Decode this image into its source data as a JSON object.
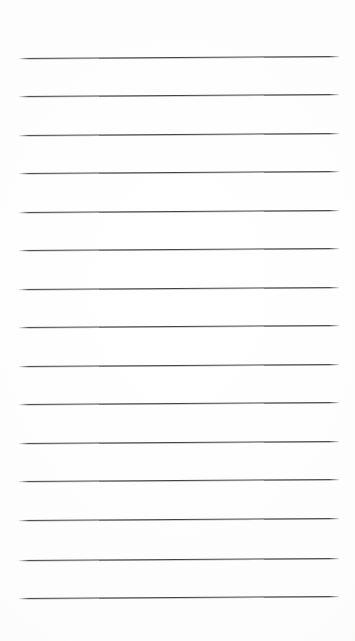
{
  "page": {
    "width": 355,
    "height": 641,
    "background_color": "#fefefe",
    "content_text": ""
  },
  "rules": {
    "name": "horizontal-rule-lines",
    "count": 15,
    "color": "#3b3b3b",
    "thickness_px": 1,
    "left_x": 19,
    "right_x": 339,
    "spacing_px": 38.5,
    "tilt_deg": -0.35,
    "y_positions": [
      58,
      96,
      135,
      173,
      212,
      250,
      289,
      327,
      366,
      404,
      443,
      481,
      520,
      560,
      598
    ]
  }
}
